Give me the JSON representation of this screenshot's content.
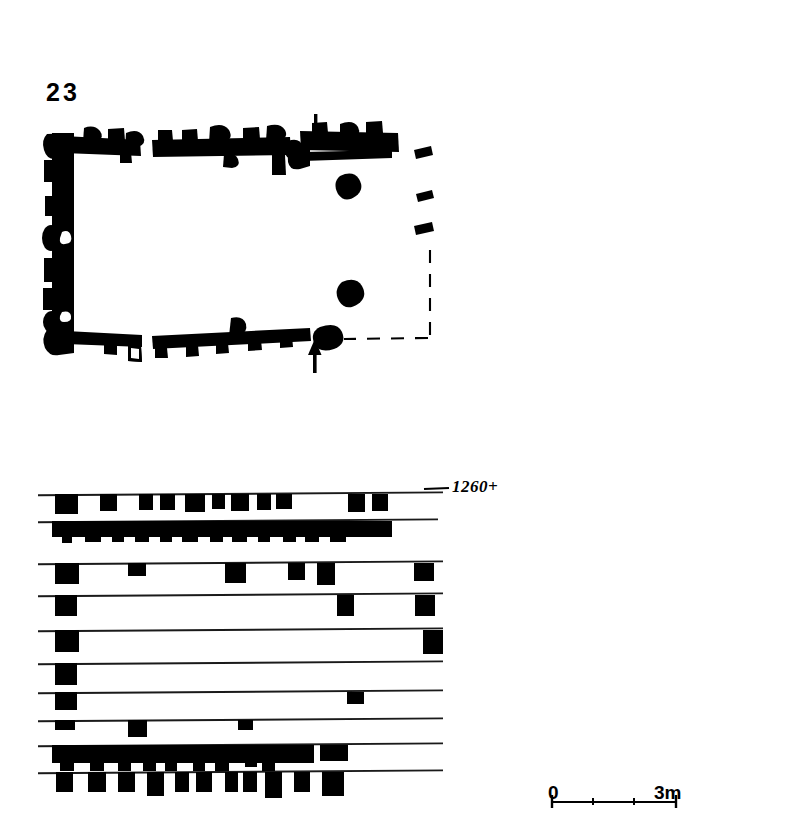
{
  "figure": {
    "number": "23",
    "caption_number_label": "23"
  },
  "plan": {
    "name": "building-plan",
    "entrance_markers": [
      {
        "id": "north-entrance",
        "direction": "down",
        "x": 316,
        "y": 116
      },
      {
        "id": "south-entrance",
        "direction": "up",
        "x": 316,
        "y": 370
      }
    ],
    "reconstructed_wall_style": "dashed",
    "interior_features": [
      {
        "id": "pillar-base-north",
        "x": 348,
        "y": 186
      },
      {
        "id": "pillar-base-south",
        "x": 350,
        "y": 293
      }
    ]
  },
  "elevation": {
    "name": "wall-course-elevation",
    "datum_label": "1260+",
    "course_count": 10
  },
  "scale_bar": {
    "start_label": "0",
    "end_label": "3m",
    "tick_count": 4,
    "units": "m"
  },
  "colors": {
    "ink": "#000000",
    "background": "#ffffff",
    "line": "#1a1a1a"
  },
  "chart_data": {
    "type": "diagram",
    "title": "23",
    "subtitle": "",
    "xlabel": "",
    "ylabel": "",
    "datum": "1260+",
    "scale": {
      "from": 0,
      "to": 3,
      "unit": "m",
      "pixels_per_unit": 36.7
    },
    "plan_outline": {
      "left": 52,
      "top": 133,
      "right": 432,
      "bottom": 344
    },
    "elevation_courses": [
      {
        "index": 1,
        "y": 494,
        "x_start": 38,
        "x_end": 443,
        "blocks": [
          [
            55,
            23,
            20
          ],
          [
            100,
            17,
            17
          ],
          [
            139,
            14,
            16
          ],
          [
            160,
            15,
            16
          ],
          [
            185,
            20,
            18
          ],
          [
            212,
            13,
            15
          ],
          [
            231,
            18,
            17
          ],
          [
            257,
            14,
            16
          ],
          [
            276,
            16,
            15
          ],
          [
            312,
            0,
            0
          ],
          [
            348,
            17,
            18
          ],
          [
            372,
            16,
            17
          ]
        ]
      },
      {
        "index": 2,
        "y": 521,
        "x_start": 38,
        "x_end": 438,
        "blocks": [
          [
            52,
            340,
            16
          ],
          [
            62,
            10,
            22
          ],
          [
            85,
            16,
            21
          ],
          [
            112,
            12,
            21
          ],
          [
            135,
            14,
            21
          ],
          [
            160,
            12,
            21
          ],
          [
            182,
            16,
            21
          ],
          [
            210,
            13,
            21
          ],
          [
            232,
            15,
            21
          ],
          [
            258,
            12,
            21
          ],
          [
            283,
            13,
            21
          ],
          [
            305,
            14,
            21
          ],
          [
            330,
            16,
            21
          ],
          [
            362,
            28,
            12
          ]
        ]
      },
      {
        "index": 3,
        "y": 563,
        "x_start": 38,
        "x_end": 443,
        "blocks": [
          [
            55,
            24,
            21
          ],
          [
            128,
            18,
            13
          ],
          [
            225,
            21,
            20
          ],
          [
            288,
            17,
            17
          ],
          [
            317,
            18,
            22
          ],
          [
            414,
            20,
            18
          ]
        ]
      },
      {
        "index": 4,
        "y": 595,
        "x_start": 38,
        "x_end": 443,
        "blocks": [
          [
            55,
            22,
            21
          ],
          [
            337,
            17,
            21
          ],
          [
            415,
            20,
            21
          ]
        ]
      },
      {
        "index": 5,
        "y": 630,
        "x_start": 38,
        "x_end": 443,
        "blocks": [
          [
            55,
            24,
            22
          ],
          [
            423,
            20,
            24
          ]
        ]
      },
      {
        "index": 6,
        "y": 663,
        "x_start": 38,
        "x_end": 443,
        "blocks": [
          [
            55,
            22,
            22
          ]
        ]
      },
      {
        "index": 7,
        "y": 692,
        "x_start": 38,
        "x_end": 443,
        "blocks": [
          [
            55,
            22,
            18
          ],
          [
            347,
            17,
            12
          ]
        ]
      },
      {
        "index": 8,
        "y": 720,
        "x_start": 38,
        "x_end": 443,
        "blocks": [
          [
            55,
            20,
            10
          ],
          [
            128,
            19,
            17
          ],
          [
            238,
            15,
            10
          ]
        ]
      },
      {
        "index": 9,
        "y": 745,
        "x_start": 38,
        "x_end": 443,
        "blocks": [
          [
            52,
            262,
            18
          ],
          [
            60,
            14,
            26
          ],
          [
            90,
            14,
            26
          ],
          [
            118,
            13,
            26
          ],
          [
            143,
            13,
            26
          ],
          [
            165,
            12,
            26
          ],
          [
            193,
            12,
            26
          ],
          [
            215,
            14,
            26
          ],
          [
            245,
            12,
            22
          ],
          [
            262,
            13,
            26
          ],
          [
            282,
            30,
            18
          ],
          [
            320,
            28,
            16
          ]
        ]
      },
      {
        "index": 10,
        "y": 772,
        "x_start": 38,
        "x_end": 443,
        "blocks": [
          [
            56,
            17,
            20
          ],
          [
            88,
            18,
            20
          ],
          [
            118,
            17,
            20
          ],
          [
            147,
            17,
            24
          ],
          [
            175,
            14,
            20
          ],
          [
            196,
            16,
            20
          ],
          [
            225,
            13,
            20
          ],
          [
            243,
            14,
            20
          ],
          [
            265,
            17,
            26
          ],
          [
            294,
            16,
            20
          ],
          [
            322,
            22,
            24
          ]
        ]
      }
    ]
  }
}
